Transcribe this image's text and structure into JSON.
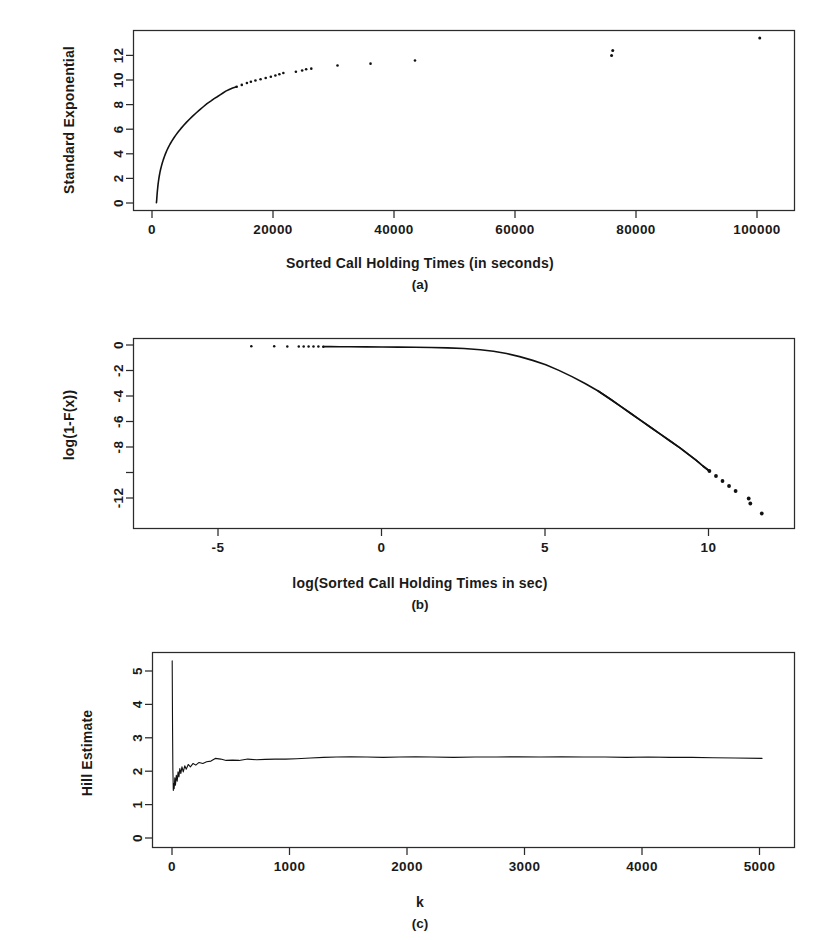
{
  "figure": {
    "title": "",
    "background": "#ffffff",
    "ink_color": "#111111",
    "panel_count": 3
  },
  "panels": {
    "a": {
      "caption": "(a)",
      "xlabel": "Sorted Call Holding Times (in seconds)",
      "ylabel": "Standard Exponential",
      "xticks": [
        "0",
        "20000",
        "40000",
        "60000",
        "80000",
        "100000"
      ],
      "yticks": [
        "0",
        "2",
        "4",
        "6",
        "8",
        "10",
        "12"
      ]
    },
    "b": {
      "caption": "(b)",
      "xlabel": "log(Sorted Call Holding Times in sec)",
      "ylabel": "log(1-F(x))",
      "xticks": [
        "-5",
        "0",
        "5",
        "10"
      ],
      "yticks": [
        "0",
        "-2",
        "-4",
        "-6",
        "-8",
        "-12"
      ]
    },
    "c": {
      "caption": "(c)",
      "xlabel": "k",
      "ylabel": "Hill Estimate",
      "xticks": [
        "0",
        "1000",
        "2000",
        "3000",
        "4000",
        "5000"
      ],
      "yticks": [
        "0",
        "1",
        "2",
        "3",
        "4",
        "5"
      ]
    }
  },
  "chart_data": [
    {
      "id": "a",
      "type": "scatter",
      "title": "",
      "xlabel": "Sorted Call Holding Times (in seconds)",
      "ylabel": "Standard Exponential",
      "xlim": [
        -4000,
        112000
      ],
      "ylim": [
        -0.6,
        13.8
      ],
      "xticks": [
        0,
        20000,
        40000,
        60000,
        80000,
        100000
      ],
      "yticks": [
        0,
        2,
        4,
        6,
        8,
        10,
        12
      ],
      "grid": false,
      "legend": null,
      "notes": "Exponential QQ plot of sorted call holding times; dense concave curve near origin that breaks into sparse discrete points in the upper tail, with isolated outliers near x=80000 and x=106000.",
      "points": [
        [
          20,
          0.02
        ],
        [
          40,
          0.09
        ],
        [
          60,
          0.18
        ],
        [
          80,
          0.3
        ],
        [
          100,
          0.45
        ],
        [
          130,
          0.62
        ],
        [
          160,
          0.8
        ],
        [
          200,
          1.0
        ],
        [
          250,
          1.22
        ],
        [
          300,
          1.45
        ],
        [
          370,
          1.7
        ],
        [
          450,
          1.95
        ],
        [
          540,
          2.2
        ],
        [
          640,
          2.45
        ],
        [
          760,
          2.7
        ],
        [
          900,
          2.95
        ],
        [
          1050,
          3.2
        ],
        [
          1220,
          3.45
        ],
        [
          1410,
          3.7
        ],
        [
          1620,
          3.95
        ],
        [
          1850,
          4.2
        ],
        [
          2110,
          4.45
        ],
        [
          2400,
          4.7
        ],
        [
          2720,
          4.95
        ],
        [
          3070,
          5.2
        ],
        [
          3450,
          5.45
        ],
        [
          3860,
          5.7
        ],
        [
          4300,
          5.95
        ],
        [
          4780,
          6.2
        ],
        [
          5280,
          6.45
        ],
        [
          5820,
          6.7
        ],
        [
          6380,
          6.95
        ],
        [
          6980,
          7.2
        ],
        [
          7600,
          7.45
        ],
        [
          8250,
          7.7
        ],
        [
          8900,
          7.95
        ],
        [
          9550,
          8.15
        ],
        [
          10150,
          8.35
        ],
        [
          10700,
          8.5
        ],
        [
          11200,
          8.65
        ],
        [
          11700,
          8.8
        ],
        [
          12200,
          8.95
        ],
        [
          12800,
          9.08
        ],
        [
          13400,
          9.2
        ],
        [
          14100,
          9.3
        ],
        [
          15000,
          9.45
        ],
        [
          15900,
          9.6
        ],
        [
          16600,
          9.7
        ],
        [
          17400,
          9.8
        ],
        [
          18300,
          9.9
        ],
        [
          19200,
          10.0
        ],
        [
          20100,
          10.1
        ],
        [
          20900,
          10.2
        ],
        [
          21600,
          10.3
        ],
        [
          22300,
          10.4
        ],
        [
          24500,
          10.5
        ],
        [
          25600,
          10.6
        ],
        [
          26300,
          10.7
        ],
        [
          27200,
          10.75
        ],
        [
          31800,
          11.0
        ],
        [
          37600,
          11.15
        ],
        [
          45400,
          11.4
        ],
        [
          79900,
          11.8
        ],
        [
          80100,
          12.2
        ],
        [
          105900,
          13.2
        ]
      ]
    },
    {
      "id": "b",
      "type": "scatter",
      "title": "",
      "xlabel": "log(Sorted Call Holding Times in sec)",
      "ylabel": "log(1-F(x))",
      "xlim": [
        -7.6,
        12.6
      ],
      "ylim": [
        -14.6,
        0.6
      ],
      "xticks": [
        -5,
        0,
        5,
        10
      ],
      "yticks": [
        0,
        -2,
        -4,
        -6,
        -8,
        -12
      ],
      "grid": false,
      "legend": null,
      "notes": "Log-log complementary CDF. Flat near zero for small x, bending down after x~3 and decaying nearly linearly (heavy tail) past x~7; tail breaks into discrete points near x=10 to 11.6.",
      "points": [
        [
          -4.0,
          -0.02
        ],
        [
          -3.3,
          -0.02
        ],
        [
          -2.9,
          -0.03
        ],
        [
          -2.55,
          -0.03
        ],
        [
          -2.4,
          -0.035
        ],
        [
          -2.25,
          -0.04
        ],
        [
          -2.1,
          -0.04
        ],
        [
          -1.95,
          -0.045
        ],
        [
          -1.8,
          -0.05
        ],
        [
          -1.6,
          -0.05
        ],
        [
          -1.3,
          -0.06
        ],
        [
          -1.0,
          -0.06
        ],
        [
          -0.5,
          -0.07
        ],
        [
          0.0,
          -0.08
        ],
        [
          0.5,
          -0.09
        ],
        [
          1.0,
          -0.1
        ],
        [
          1.5,
          -0.12
        ],
        [
          2.0,
          -0.15
        ],
        [
          2.5,
          -0.2
        ],
        [
          3.0,
          -0.3
        ],
        [
          3.4,
          -0.42
        ],
        [
          3.8,
          -0.6
        ],
        [
          4.2,
          -0.85
        ],
        [
          4.6,
          -1.15
        ],
        [
          5.0,
          -1.5
        ],
        [
          5.4,
          -1.95
        ],
        [
          5.8,
          -2.45
        ],
        [
          6.2,
          -3.0
        ],
        [
          6.6,
          -3.6
        ],
        [
          7.0,
          -4.3
        ],
        [
          7.3,
          -4.85
        ],
        [
          7.6,
          -5.4
        ],
        [
          7.9,
          -5.95
        ],
        [
          8.2,
          -6.5
        ],
        [
          8.5,
          -7.05
        ],
        [
          8.8,
          -7.6
        ],
        [
          9.1,
          -8.15
        ],
        [
          9.35,
          -8.65
        ],
        [
          9.6,
          -9.15
        ],
        [
          9.8,
          -9.6
        ],
        [
          10.0,
          -10.0
        ],
        [
          10.2,
          -10.4
        ],
        [
          10.4,
          -10.8
        ],
        [
          10.6,
          -11.2
        ],
        [
          10.8,
          -11.6
        ],
        [
          11.2,
          -12.2
        ],
        [
          11.25,
          -12.6
        ],
        [
          11.6,
          -13.4
        ]
      ]
    },
    {
      "id": "c",
      "type": "line",
      "title": "",
      "xlabel": "k",
      "ylabel": "Hill Estimate",
      "xlim": [
        -180,
        5750
      ],
      "ylim": [
        -0.35,
        5.45
      ],
      "xticks": [
        0,
        1000,
        2000,
        3000,
        4000,
        5000
      ],
      "yticks": [
        0,
        1,
        2,
        3,
        4,
        5
      ],
      "grid": false,
      "legend": null,
      "notes": "Hill estimator plot. Sharp vertical spike at very small k reaching about 5.2, dropping to about 1.3, then oscillating upward and stabilizing near 2.3 for k greater than about 500.",
      "x": [
        2,
        5,
        8,
        12,
        16,
        20,
        26,
        32,
        40,
        48,
        56,
        64,
        72,
        82,
        92,
        104,
        118,
        132,
        150,
        170,
        195,
        220,
        250,
        285,
        320,
        360,
        400,
        450,
        500,
        560,
        620,
        700,
        780,
        860,
        950,
        1050,
        1150,
        1280,
        1400,
        1520,
        1650,
        1800,
        1950,
        2100,
        2250,
        2400,
        2600,
        2800,
        3000,
        3200,
        3400,
        3600,
        3800,
        4000,
        4200,
        4400,
        4600,
        4800,
        5000,
        5200,
        5450
      ],
      "y": [
        5.2,
        3.3,
        2.0,
        1.35,
        1.55,
        1.4,
        1.72,
        1.5,
        1.8,
        1.62,
        1.9,
        1.75,
        2.0,
        1.85,
        2.05,
        1.9,
        2.08,
        1.98,
        2.12,
        2.05,
        2.15,
        2.1,
        2.18,
        2.15,
        2.2,
        2.22,
        2.3,
        2.28,
        2.24,
        2.25,
        2.24,
        2.28,
        2.26,
        2.27,
        2.28,
        2.28,
        2.29,
        2.31,
        2.33,
        2.34,
        2.35,
        2.34,
        2.33,
        2.34,
        2.35,
        2.34,
        2.33,
        2.34,
        2.34,
        2.35,
        2.34,
        2.35,
        2.34,
        2.34,
        2.33,
        2.34,
        2.33,
        2.33,
        2.32,
        2.31,
        2.3
      ]
    }
  ]
}
